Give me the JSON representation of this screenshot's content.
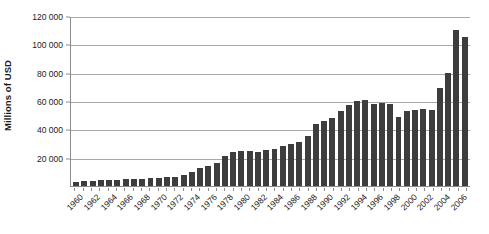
{
  "chart_data": {
    "type": "bar",
    "title": "",
    "subtitle": "",
    "xlabel": "",
    "ylabel": "Millions of USD",
    "ylim": [
      0,
      120000
    ],
    "ytick_labels": [
      "120 000",
      "100 000",
      "80 000",
      "60 000",
      "40 000",
      "20 000"
    ],
    "ytick_values": [
      120000,
      100000,
      80000,
      60000,
      40000,
      20000
    ],
    "grid": true,
    "legend": null,
    "legend_position": "none",
    "xtick_labels": [
      "1960",
      "1962",
      "1964",
      "1966",
      "1968",
      "1970",
      "1972",
      "1974",
      "1976",
      "1978",
      "1980",
      "1982",
      "1984",
      "1986",
      "1988",
      "1990",
      "1992",
      "1994",
      "1996",
      "1998",
      "2000",
      "2002",
      "2004",
      "2006"
    ],
    "xtick_step": 2,
    "categories": [
      "1960",
      "1961",
      "1962",
      "1963",
      "1964",
      "1965",
      "1966",
      "1967",
      "1968",
      "1969",
      "1970",
      "1971",
      "1972",
      "1973",
      "1974",
      "1975",
      "1976",
      "1977",
      "1978",
      "1979",
      "1980",
      "1981",
      "1982",
      "1983",
      "1984",
      "1985",
      "1986",
      "1987",
      "1988",
      "1989",
      "1990",
      "1991",
      "1992",
      "1993",
      "1994",
      "1995",
      "1996",
      "1997",
      "1998",
      "1999",
      "2000",
      "2001",
      "2002",
      "2003",
      "2004",
      "2005",
      "2006",
      "2007"
    ],
    "values": [
      3000,
      3500,
      3800,
      4000,
      4200,
      4500,
      4800,
      5000,
      5200,
      5500,
      6000,
      6200,
      6500,
      8000,
      10000,
      12500,
      14000,
      16000,
      21000,
      24000,
      25000,
      24500,
      24000,
      25500,
      26000,
      28000,
      29500,
      31000,
      35000,
      44000,
      46000,
      48000,
      53000,
      57000,
      60000,
      60500,
      58000,
      58500,
      58000,
      49000,
      53000,
      54000,
      54500,
      54000,
      69000,
      80000,
      110000,
      105000
    ],
    "bar_color": "#3d3d3d",
    "grid_color": "#a8a8a8",
    "axis_color": "#8c8c8c",
    "background_color": "#ffffff"
  }
}
